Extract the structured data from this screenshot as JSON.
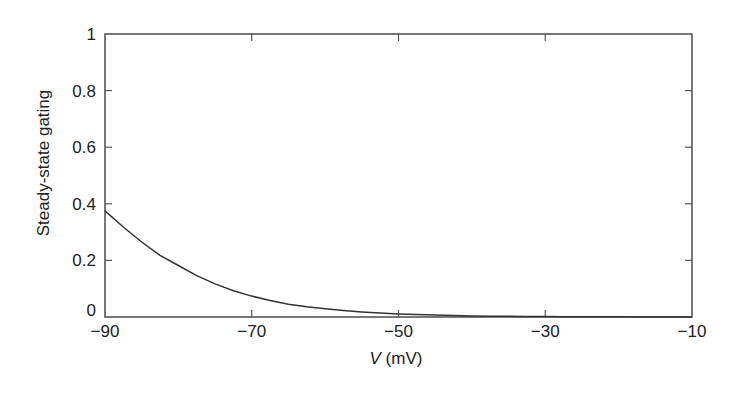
{
  "chart_data": {
    "type": "line",
    "title": "",
    "xlabel": "V (mV)",
    "xlabel_var": "V",
    "xlabel_unit": " (mV)",
    "ylabel": "Steady-state gating",
    "xlim": [
      -90,
      -10
    ],
    "ylim": [
      0,
      1
    ],
    "xticks": [
      -90,
      -70,
      -50,
      -30,
      -10
    ],
    "xtick_labels": [
      "−90",
      "−70",
      "−50",
      "−30",
      "−10"
    ],
    "yticks": [
      0,
      0.2,
      0.4,
      0.6,
      0.8,
      1
    ],
    "ytick_labels": [
      "0",
      "0.2",
      "0.4",
      "0.6",
      "0.8",
      "1"
    ],
    "grid": false,
    "legend": null,
    "series": [
      {
        "name": "steady-state gating",
        "color": "#333333",
        "x": [
          -90,
          -87.5,
          -85,
          -82.5,
          -80,
          -77.5,
          -75,
          -72.5,
          -70,
          -67.5,
          -65,
          -62.5,
          -60,
          -57.5,
          -55,
          -52.5,
          -50,
          -47.5,
          -45,
          -42.5,
          -40,
          -37.5,
          -35,
          -32.5,
          -30,
          -27.5,
          -25,
          -22.5,
          -20,
          -17.5,
          -15,
          -12.5,
          -10
        ],
        "values": [
          0.375,
          0.318,
          0.265,
          0.218,
          0.182,
          0.146,
          0.117,
          0.093,
          0.074,
          0.058,
          0.045,
          0.036,
          0.029,
          0.023,
          0.018,
          0.014,
          0.011,
          0.009,
          0.007,
          0.005,
          0.004,
          0.003,
          0.0025,
          0.002,
          0.0015,
          0.0012,
          0.0009,
          0.0007,
          0.0006,
          0.0004,
          0.0003,
          0.0003,
          0.0002
        ]
      }
    ]
  },
  "style": {
    "axis_color": "#555555",
    "line_color": "#333333",
    "text_color": "#222222"
  },
  "layout": {
    "plot_left": 105,
    "plot_right": 692,
    "plot_top": 34,
    "plot_bottom": 317
  }
}
